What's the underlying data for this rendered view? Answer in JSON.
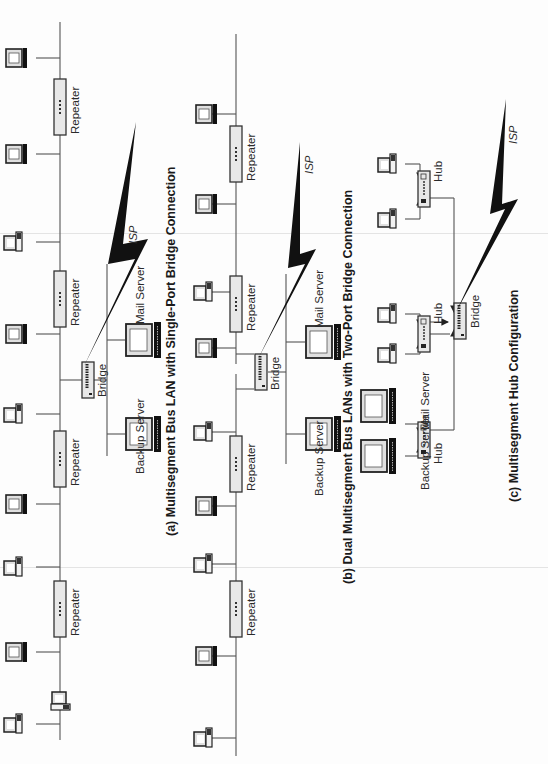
{
  "figure": {
    "orientation": "rotated 90 degrees counter-clockwise",
    "panels": [
      {
        "id": "a",
        "caption": "(a) Multisegment Bus LAN with Single-Port Bridge Connection",
        "repeater_labels": [
          "Repeater",
          "Repeater",
          "Repeater",
          "Repeater"
        ],
        "bridge_label": "Bridge",
        "servers": [
          "Backup Server",
          "Mail Server"
        ],
        "isp_label": "ISP"
      },
      {
        "id": "b",
        "caption": "(b) Dual Multisegment Bus LANs with Two-Port Bridge Connection",
        "repeater_labels": [
          "Repeater",
          "Repeater",
          "Repeater",
          "Repeater"
        ],
        "bridge_label": "Bridge",
        "servers": [
          "Backup Server",
          "Mail Server"
        ],
        "isp_label": "ISP"
      },
      {
        "id": "c",
        "caption": "(c) Multisegment Hub Configuration",
        "hub_labels": [
          "Hub",
          "Hub",
          "Hub"
        ],
        "bridge_label": "Bridge",
        "servers": [
          "Backup Server",
          "Mail Server"
        ],
        "isp_label": "ISP"
      }
    ]
  },
  "colors": {
    "line": "#555555",
    "device_fill": "#e8e8e8",
    "bolt": "#111111",
    "text": "#2a2a2a"
  }
}
